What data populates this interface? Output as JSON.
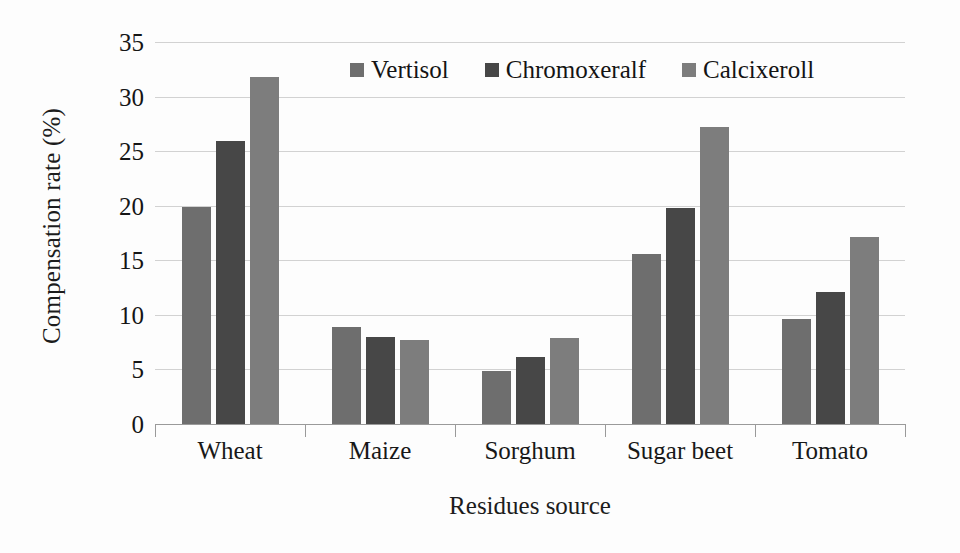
{
  "chart_data": {
    "type": "bar",
    "title": "",
    "xlabel": "Residues source",
    "ylabel": "Compensation rate (%)",
    "categories": [
      "Wheat",
      "Maize",
      "Sorghum",
      "Sugar beet",
      "Tomato"
    ],
    "series": [
      {
        "name": "Vertisol",
        "color": "#6e6e6e",
        "values": [
          19.9,
          8.9,
          4.9,
          15.6,
          9.6
        ]
      },
      {
        "name": "Chromoxeralf",
        "color": "#474747",
        "values": [
          25.9,
          8.0,
          6.1,
          19.8,
          12.1
        ]
      },
      {
        "name": "Calcixeroll",
        "color": "#7d7d7d",
        "values": [
          31.8,
          7.7,
          7.9,
          27.2,
          17.1
        ]
      }
    ],
    "ylim": [
      0,
      35
    ],
    "ytick_values": [
      0,
      5,
      10,
      15,
      20,
      25,
      30,
      35
    ],
    "ytick_labels": [
      "0",
      "5",
      "10",
      "15",
      "20",
      "25",
      "30",
      "35"
    ],
    "grid": true,
    "grid_axis": "y",
    "grid_color": "#d2d2d2",
    "legend_position": "top-center",
    "background_color": "#fdfdfd",
    "axis_color": "#9a9a9a"
  }
}
